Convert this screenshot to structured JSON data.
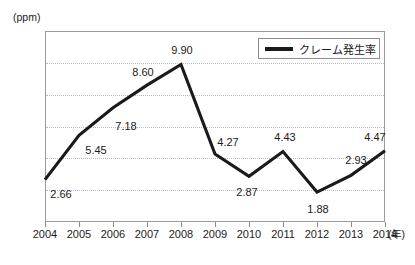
{
  "chart_data": {
    "type": "line",
    "title": "",
    "xlabel": "(年)",
    "ylabel": "(ppm)",
    "categories": [
      "2004",
      "2005",
      "2006",
      "2007",
      "2008",
      "2009",
      "2010",
      "2011",
      "2012",
      "2013",
      "2014"
    ],
    "values": [
      2.66,
      5.45,
      7.18,
      8.6,
      9.9,
      4.27,
      2.87,
      4.43,
      1.88,
      2.93,
      4.47
    ],
    "point_labels": [
      "2.66",
      "5.45",
      "7.18",
      "8.60",
      "9.90",
      "4.27",
      "2.87",
      "4.43",
      "1.88",
      "2.93",
      "4.47"
    ],
    "series": [
      {
        "name": "クレーム発生率",
        "values": [
          2.66,
          5.45,
          7.18,
          8.6,
          9.9,
          4.27,
          2.87,
          4.43,
          1.88,
          2.93,
          4.47
        ],
        "color": "#1a1a1a"
      }
    ],
    "ylim": [
      0,
      12
    ],
    "yticks": [
      "0",
      "2",
      "4",
      "6",
      "8",
      "10",
      "12"
    ],
    "ytick_values": [
      0,
      2,
      4,
      6,
      8,
      10,
      12
    ],
    "grid": true,
    "grid_axis": "y",
    "legend_position": "top-right"
  },
  "axes": {
    "y_unit": "(ppm)",
    "x_unit": "(年)"
  },
  "legend": {
    "entries": [
      {
        "label": "クレーム発生率",
        "color": "#1a1a1a",
        "marker": "line-swatch"
      }
    ]
  },
  "colors": {
    "series_line": "#1a1a1a",
    "grid": "#b9b9c9",
    "frame": "#9a9a9a",
    "text": "#1a1a1a",
    "background": "#ffffff"
  }
}
